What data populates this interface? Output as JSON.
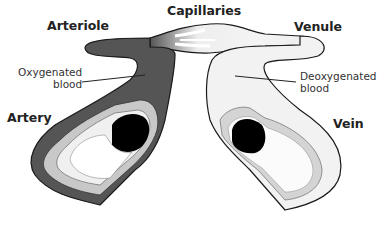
{
  "diagram": {
    "labels": {
      "capillaries": "Capillaries",
      "arteriole": "Arteriole",
      "venule": "Venule",
      "artery": "Artery",
      "vein": "Vein",
      "oxygenated_line1": "Oxygenated",
      "oxygenated_line2": "blood",
      "deoxygenated_line1": "Deoxygenated",
      "deoxygenated_line2": "blood"
    },
    "colors": {
      "artery_outer": "#555555",
      "artery_middle": "#c8c8c8",
      "artery_inner": "#efefef",
      "lumen": "#000000",
      "vein_outer": "#f2f2f2",
      "vein_middle": "#d3d3d3",
      "outline": "#1a1a1a",
      "background": "#ffffff"
    }
  }
}
